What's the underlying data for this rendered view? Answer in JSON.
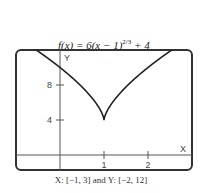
{
  "chart_data": {
    "type": "line",
    "title_parts": {
      "pre": "f(x) = 6(x − 1)",
      "exp": "2/3",
      "post": " + 4"
    },
    "function": "6*cbrt((x-1)^2)+4",
    "xlabel": "X",
    "ylabel": "Y",
    "xlim": [
      -1,
      3
    ],
    "ylim": [
      -2,
      12
    ],
    "x_ticks": [
      1,
      2
    ],
    "y_ticks": [
      4,
      8
    ],
    "x_tick_labels": [
      "1",
      "2"
    ],
    "y_tick_labels": [
      "4",
      "8"
    ],
    "grid": false,
    "caption": "X: [−1, 3] and Y: [−2, 12]",
    "key_points": [
      {
        "x": 1,
        "y": 4,
        "note": "cusp minimum"
      }
    ],
    "line_color": "#222222"
  }
}
